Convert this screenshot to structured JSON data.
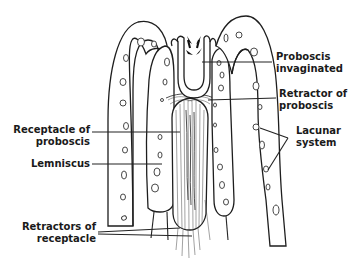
{
  "figure": {
    "background_color": "#ffffff",
    "line_color": "#1e1e1e"
  },
  "labels": {
    "proboscis_invaginated": {
      "line1": "Proboscis",
      "line2": "invaginated"
    },
    "retractor_of_proboscis": {
      "line1": "Retractor of",
      "line2": "proboscis"
    },
    "lacunar_system": {
      "line1": "Lacunar",
      "line2": "system"
    },
    "receptacle_of_proboscis": {
      "line1": "Receptacle of",
      "line2": "proboscis"
    },
    "lemniscus": {
      "line1": "Lemniscus"
    },
    "retractors_of_receptacle": {
      "line1": "Retractors of",
      "line2": "receptacle"
    }
  }
}
